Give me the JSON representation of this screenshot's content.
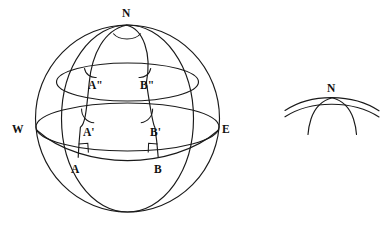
{
  "figure": {
    "title": "Spherical triangle diagram with north pole N, equator endpoints W and E",
    "stroke_color": "#1a1a1a",
    "background_color": "#ffffff",
    "label_color": "#111111"
  },
  "main_sphere": {
    "name": "sphere-diagram",
    "points": {
      "north_pole": {
        "label": "N",
        "x": 126,
        "y": 25,
        "label_x": 122,
        "label_y": 17
      },
      "west": {
        "label": "W",
        "x": 36,
        "y": 128,
        "label_x": 14,
        "label_y": 133
      },
      "east": {
        "label": "E",
        "x": 219,
        "y": 128,
        "label_x": 222,
        "label_y": 133
      },
      "a_double_prime": {
        "label": "A\"",
        "x": 89,
        "y": 83,
        "label_x": 89,
        "label_y": 88
      },
      "b_double_prime": {
        "label": "B\"",
        "x": 146,
        "y": 83,
        "label_x": 142,
        "label_y": 88
      },
      "a_prime": {
        "label": "A'",
        "x": 80,
        "y": 127,
        "label_x": 82,
        "label_y": 135
      },
      "b_prime": {
        "label": "B'",
        "x": 155,
        "y": 127,
        "label_x": 152,
        "label_y": 135
      },
      "a": {
        "label": "A",
        "x": 78,
        "y": 157,
        "label_x": 72,
        "label_y": 172
      },
      "b": {
        "label": "B",
        "x": 158,
        "y": 157,
        "label_x": 155,
        "label_y": 172
      }
    },
    "angle_marks": [
      {
        "name": "angle-at-north-pole",
        "vertex": "N"
      },
      {
        "name": "angle-at-a-double-prime",
        "vertex": "A\""
      },
      {
        "name": "angle-at-b-double-prime",
        "vertex": "B\""
      },
      {
        "name": "angle-at-a-prime",
        "vertex": "A'"
      },
      {
        "name": "angle-at-b-prime",
        "vertex": "B'"
      }
    ],
    "right_angle_marks": [
      {
        "name": "right-angle-at-a",
        "vertex": "A"
      },
      {
        "name": "right-angle-at-b",
        "vertex": "B"
      }
    ]
  },
  "detail_inset": {
    "name": "pole-detail-inset",
    "points": {
      "north_pole": {
        "label": "N",
        "x": 332,
        "y": 98,
        "label_x": 327,
        "label_y": 92
      }
    }
  }
}
